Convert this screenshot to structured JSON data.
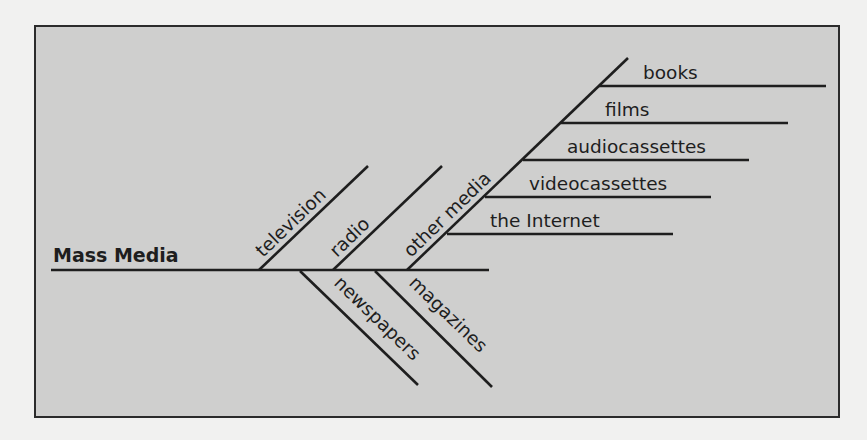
{
  "diagram": {
    "type": "fishbone",
    "root": {
      "label": "Mass Media"
    },
    "branches_above": [
      {
        "label": "television"
      },
      {
        "label": "radio"
      },
      {
        "label": "other media"
      }
    ],
    "branches_below": [
      {
        "label": "newspapers"
      },
      {
        "label": "magazines"
      }
    ],
    "other_media_subbranches": [
      {
        "label": "books"
      },
      {
        "label": "films"
      },
      {
        "label": "audiocassettes"
      },
      {
        "label": "videocassettes"
      },
      {
        "label": "the Internet"
      }
    ],
    "colors": {
      "panel_background": "#cfcfce",
      "page_background": "#f1f1f0",
      "line_and_text": "#1e1e1e",
      "border": "#2b2b2b"
    }
  }
}
